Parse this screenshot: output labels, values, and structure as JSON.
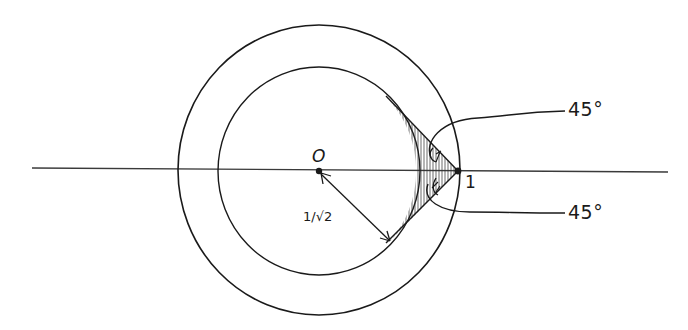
{
  "diagram": {
    "type": "geometry-figure",
    "colors": {
      "stroke": "#1a1a1a",
      "background": "#ffffff",
      "axis": "#3a3a3a"
    },
    "labels": {
      "origin": "O",
      "point_one": "1",
      "radius": "1/√2",
      "angle_top": "45°",
      "angle_bottom": "45°"
    },
    "elements": {
      "center": {
        "x": 319,
        "y": 171
      },
      "outer_circle_radius": 140,
      "inner_circle_radius": 100,
      "point_one": {
        "x": 458,
        "y": 171
      },
      "tangent_points": [
        {
          "x": 389,
          "y": 100
        },
        {
          "x": 389,
          "y": 242
        }
      ],
      "axis": {
        "x1": 32,
        "x2": 668,
        "y": 170
      }
    }
  }
}
